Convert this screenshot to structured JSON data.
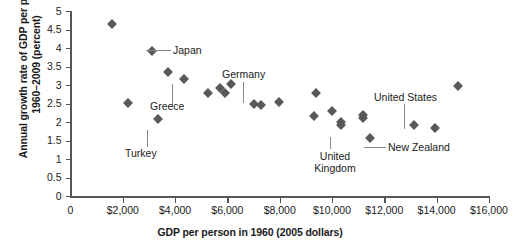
{
  "chart_data": {
    "type": "scatter",
    "title": "",
    "xlabel": "GDP per person in 1960 (2005 dollars)",
    "ylabel": "Annual growth rate of GDP per person 1960–2009 (percent)",
    "xlim": [
      0,
      16000
    ],
    "ylim": [
      0,
      5
    ],
    "xticks": [
      0,
      2000,
      4000,
      6000,
      8000,
      10000,
      12000,
      14000,
      16000
    ],
    "xtick_labels": [
      "0",
      "$2,000",
      "$4,000",
      "$6,000",
      "$8,000",
      "$10,000",
      "$12,000",
      "$14,000",
      "$16,000"
    ],
    "yticks": [
      0,
      0.5,
      1,
      1.5,
      2,
      2.5,
      3,
      3.5,
      4,
      4.5,
      5
    ],
    "ytick_labels": [
      "0",
      "0.5",
      "1",
      "1.5",
      "2",
      "2.5",
      "3",
      "3.5",
      "4",
      "4.5",
      "5"
    ],
    "grid": false,
    "legend": "none",
    "marker": "diamond",
    "marker_color": "#595959",
    "points": [
      {
        "x": 1570,
        "y": 4.65,
        "label": ""
      },
      {
        "x": 3100,
        "y": 3.93,
        "label": "Japan"
      },
      {
        "x": 3740,
        "y": 3.35,
        "label": ""
      },
      {
        "x": 4350,
        "y": 3.15,
        "label": "Greece"
      },
      {
        "x": 2215,
        "y": 2.52,
        "label": ""
      },
      {
        "x": 3360,
        "y": 2.08,
        "label": "Turkey"
      },
      {
        "x": 5260,
        "y": 2.78,
        "label": ""
      },
      {
        "x": 5730,
        "y": 2.93,
        "label": ""
      },
      {
        "x": 6150,
        "y": 3.02,
        "label": ""
      },
      {
        "x": 5920,
        "y": 2.78,
        "label": ""
      },
      {
        "x": 7030,
        "y": 2.48,
        "label": "Germany"
      },
      {
        "x": 7300,
        "y": 2.45,
        "label": ""
      },
      {
        "x": 7980,
        "y": 2.55,
        "label": ""
      },
      {
        "x": 9400,
        "y": 2.78,
        "label": ""
      },
      {
        "x": 9330,
        "y": 2.15,
        "label": ""
      },
      {
        "x": 10000,
        "y": 2.3,
        "label": ""
      },
      {
        "x": 10330,
        "y": 2.0,
        "label": "United Kingdom"
      },
      {
        "x": 10330,
        "y": 1.93,
        "label": ""
      },
      {
        "x": 11200,
        "y": 2.18,
        "label": ""
      },
      {
        "x": 11200,
        "y": 2.1,
        "label": ""
      },
      {
        "x": 11450,
        "y": 1.58,
        "label": "New Zealand"
      },
      {
        "x": 13150,
        "y": 1.92,
        "label": "United States"
      },
      {
        "x": 13950,
        "y": 1.83,
        "label": ""
      },
      {
        "x": 14800,
        "y": 2.98,
        "label": ""
      }
    ],
    "annotations": [
      {
        "text": "Japan",
        "anchor_x": 3100,
        "anchor_y": 3.93
      },
      {
        "text": "Greece",
        "anchor_x": 4350,
        "anchor_y": 3.15
      },
      {
        "text": "Turkey",
        "anchor_x": 3360,
        "anchor_y": 2.08
      },
      {
        "text": "Germany",
        "anchor_x": 7030,
        "anchor_y": 2.48
      },
      {
        "text": "United\nKingdom",
        "anchor_x": 10330,
        "anchor_y": 1.93
      },
      {
        "text": "New Zealand",
        "anchor_x": 11450,
        "anchor_y": 1.58
      },
      {
        "text": "United States",
        "anchor_x": 13150,
        "anchor_y": 1.92
      }
    ]
  },
  "axes": {
    "ylabel": "Annual growth rate of GDP per person 1960–2009 (percent)",
    "xlabel": "GDP per person in 1960 (2005 dollars)"
  },
  "labels": {
    "japan": "Japan",
    "greece": "Greece",
    "turkey": "Turkey",
    "germany": "Germany",
    "united_kingdom": "United\nKingdom",
    "new_zealand": "New Zealand",
    "united_states": "United States"
  },
  "yticks": {
    "t0": "0",
    "t1": "0.5",
    "t2": "1",
    "t3": "1.5",
    "t4": "2",
    "t5": "2.5",
    "t6": "3",
    "t7": "3.5",
    "t8": "4",
    "t9": "4.5",
    "t10": "5"
  },
  "xticks": {
    "t0": "0",
    "t1": "$2,000",
    "t2": "$4,000",
    "t3": "$6,000",
    "t4": "$8,000",
    "t5": "$10,000",
    "t6": "$12,000",
    "t7": "$14,000",
    "t8": "$16,000"
  }
}
